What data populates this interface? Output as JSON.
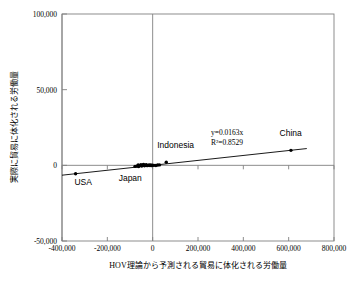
{
  "chart_data": {
    "type": "scatter",
    "title": "",
    "xlabel": "HOV理論から予測される貿易に体化される労働量",
    "ylabel": "実際に貿易に体化される労働量",
    "xlim": [
      -400000,
      800000
    ],
    "ylim": [
      -50000,
      100000
    ],
    "xticks": [
      "-400,000",
      "-200,000",
      "0",
      "200,000",
      "400,000",
      "600,000",
      "800,000"
    ],
    "xtick_values": [
      -400000,
      -200000,
      0,
      200000,
      400000,
      600000,
      800000
    ],
    "yticks": [
      "100,000",
      "50,000",
      "0",
      "-50,000"
    ],
    "ytick_values": [
      100000,
      50000,
      0,
      -50000
    ],
    "grid": false,
    "legend": "none",
    "annotations": {
      "equation": "y=0.0163x",
      "r_squared": "R²=0.8529"
    },
    "trendline": {
      "slope": 0.0163,
      "intercept": 0,
      "x_start": -400000,
      "x_end": 680000
    },
    "points": [
      {
        "label": "USA",
        "x": -340000,
        "y": -5600
      },
      {
        "label": "China",
        "x": 610000,
        "y": 9900
      },
      {
        "label": "Indonesia",
        "x": 60000,
        "y": 2000
      },
      {
        "label": "Japan",
        "x": -62000,
        "y": -800
      },
      {
        "label": "",
        "x": -78000,
        "y": -700
      },
      {
        "label": "",
        "x": -70000,
        "y": -500
      },
      {
        "label": "",
        "x": -64000,
        "y": 300
      },
      {
        "label": "",
        "x": -58000,
        "y": -200
      },
      {
        "label": "",
        "x": -52000,
        "y": 500
      },
      {
        "label": "",
        "x": -48000,
        "y": -400
      },
      {
        "label": "",
        "x": -44000,
        "y": 200
      },
      {
        "label": "",
        "x": -40000,
        "y": 600
      },
      {
        "label": "",
        "x": -36000,
        "y": -300
      },
      {
        "label": "",
        "x": -32000,
        "y": 100
      },
      {
        "label": "",
        "x": -28000,
        "y": 400
      },
      {
        "label": "",
        "x": -24000,
        "y": -200
      },
      {
        "label": "",
        "x": -20000,
        "y": 0
      },
      {
        "label": "",
        "x": -16000,
        "y": 300
      },
      {
        "label": "",
        "x": -12000,
        "y": -100
      },
      {
        "label": "",
        "x": -8000,
        "y": 200
      },
      {
        "label": "",
        "x": -4000,
        "y": -200
      },
      {
        "label": "",
        "x": 0,
        "y": 100
      },
      {
        "label": "",
        "x": 6000,
        "y": 0
      },
      {
        "label": "",
        "x": 14000,
        "y": -100
      },
      {
        "label": "",
        "x": 22000,
        "y": 200
      },
      {
        "label": "",
        "x": 30000,
        "y": 300
      }
    ],
    "point_labels": [
      {
        "text": "USA",
        "x": -345000,
        "y": -13000
      },
      {
        "text": "Japan",
        "x": -150000,
        "y": -10500
      },
      {
        "text": "Indonesia",
        "x": 20000,
        "y": 11500
      },
      {
        "text": "China",
        "x": 560000,
        "y": 19500
      }
    ],
    "colors": {
      "marker": "#000000",
      "trendline": "#000000",
      "axis": "#808080",
      "frame": "#808080",
      "text": "#000000",
      "background": "#ffffff"
    }
  }
}
